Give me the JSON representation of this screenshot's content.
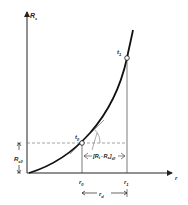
{
  "diagram": {
    "y_axis_label": "R",
    "y_axis_label_sub": "s",
    "x_axis_label": "r",
    "points": [
      {
        "name": "t",
        "sub": "0",
        "x": 82,
        "y": 143
      },
      {
        "name": "t",
        "sub": "1",
        "x": 127,
        "y": 58
      }
    ],
    "x_ticks": [
      {
        "label": "r",
        "sub": "0"
      },
      {
        "label": "r",
        "sub": "1"
      }
    ],
    "left_dimension": {
      "label": "R",
      "sub": "s0"
    },
    "bracket_label": {
      "open": "[",
      "a": "R",
      "a_sub": "t",
      "op": "-",
      "b": "R",
      "b_sub": "s",
      "close": "]",
      "close_sub": "t0"
    },
    "bottom_dimension": {
      "label": "r",
      "sub": "d"
    },
    "colors": {
      "line": "#1a1a1a",
      "thin": "#555555",
      "dashed": "#666666"
    }
  }
}
